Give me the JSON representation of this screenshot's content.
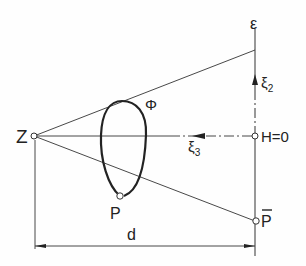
{
  "diagram": {
    "labels": {
      "z": "Z",
      "p": "P",
      "p_bar": "P",
      "epsilon": "ε",
      "h0": "H=0",
      "phi": "Φ",
      "xi2_base": "ξ",
      "xi2_sub": "2",
      "xi3_base": "ξ",
      "xi3_sub": "3",
      "d": "d"
    },
    "colors": {
      "stroke": "#333333",
      "text": "#222222",
      "background": "#fefefe"
    }
  }
}
